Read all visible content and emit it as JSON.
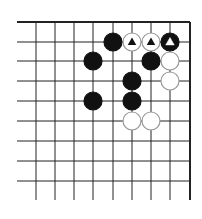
{
  "board": {
    "x_lines": [
      36,
      55,
      74,
      93,
      113,
      132,
      151,
      170,
      190
    ],
    "y_lines": [
      22,
      42,
      61,
      81,
      101,
      121,
      141,
      161,
      181
    ],
    "left": 17,
    "right": 190,
    "top": 22,
    "bottom": 200,
    "stone_radius": 9,
    "colors": {
      "line": "#222222",
      "black": "#111111",
      "white": "#ffffff",
      "white_border": "#999999"
    }
  },
  "stones": [
    {
      "x": 113,
      "y": 42,
      "color": "black",
      "mark": ""
    },
    {
      "x": 132,
      "y": 42,
      "color": "white",
      "mark": "triangle"
    },
    {
      "x": 151,
      "y": 42,
      "color": "white",
      "mark": "triangle"
    },
    {
      "x": 170,
      "y": 42,
      "color": "black",
      "mark": "triangle"
    },
    {
      "x": 93,
      "y": 61,
      "color": "black",
      "mark": ""
    },
    {
      "x": 151,
      "y": 61,
      "color": "black",
      "mark": ""
    },
    {
      "x": 170,
      "y": 61,
      "color": "white",
      "mark": ""
    },
    {
      "x": 132,
      "y": 81,
      "color": "black",
      "mark": ""
    },
    {
      "x": 170,
      "y": 81,
      "color": "white",
      "mark": ""
    },
    {
      "x": 93,
      "y": 101,
      "color": "black",
      "mark": ""
    },
    {
      "x": 132,
      "y": 101,
      "color": "black",
      "mark": ""
    },
    {
      "x": 132,
      "y": 121,
      "color": "white",
      "mark": ""
    },
    {
      "x": 151,
      "y": 121,
      "color": "white",
      "mark": ""
    }
  ]
}
